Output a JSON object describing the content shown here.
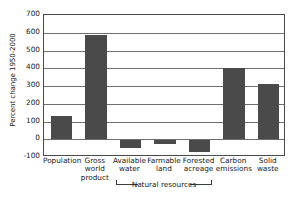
{
  "chart_data": {
    "type": "bar",
    "title": "",
    "xlabel": "",
    "ylabel": "Percent change 1950-2000",
    "ylim": [
      -100,
      700
    ],
    "ytick_step": 100,
    "yticks": [
      700,
      600,
      500,
      400,
      300,
      200,
      100,
      0,
      -100
    ],
    "ytick_labels": [
      "700",
      "600",
      "500",
      "400",
      "300",
      "200",
      "100",
      "0",
      "-100"
    ],
    "grid": true,
    "legend": null,
    "categories": [
      "Population",
      "Gross world product",
      "Available water",
      "Farmable land",
      "Forested acreage",
      "Carbon emissions",
      "Solid waste"
    ],
    "category_labels": [
      "Population",
      "Gross\nworld\nproduct",
      "Available\nwater",
      "Farmable\nland",
      "Forested\nacreage",
      "Carbon\nemissions",
      "Solid\nwaste"
    ],
    "values": [
      130,
      585,
      -50,
      -25,
      -72,
      400,
      310
    ],
    "bar_color": "#4a4a4a",
    "annotations": [
      {
        "text": "Natural resources",
        "spans": [
          "Available water",
          "Farmable land",
          "Forested acreage"
        ]
      }
    ]
  }
}
